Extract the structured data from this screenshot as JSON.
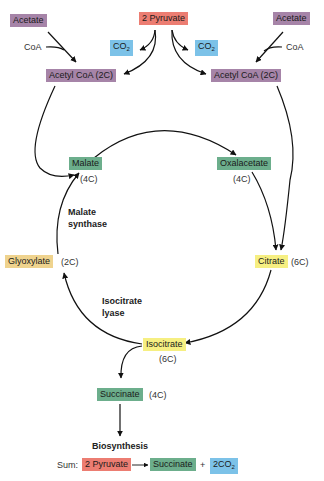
{
  "nodes": {
    "acetate_left": "Acetate",
    "acetate_right": "Acetate",
    "pyruvate": "2 Pyruvate",
    "co2_left": "CO",
    "co2_right": "CO",
    "co2_sub": "2",
    "acetylcoa_left": "Acetyl CoA (2C)",
    "acetylcoa_right": "Acetyl CoA (2C)",
    "malate": "Malate",
    "oxalacetate": "Oxalacetate",
    "glyoxylate": "Glyoxylate",
    "citrate": "Citrate",
    "isocitrate": "Isocitrate",
    "succinate": "Succinate"
  },
  "labels": {
    "coa_left": "CoA",
    "coa_right": "CoA",
    "malate_carbons": "(4C)",
    "oxalacetate_carbons": "(4C)",
    "glyoxylate_carbons": "(2C)",
    "citrate_carbons": "(6C)",
    "isocitrate_carbons": "(6C)",
    "succinate_carbons": "(4C)",
    "malate_synthase_1": "Malate",
    "malate_synthase_2": "synthase",
    "isocitrate_lyase_1": "Isocitrate",
    "isocitrate_lyase_2": "lyase",
    "biosynthesis": "Biosynthesis"
  },
  "sum": {
    "label": "Sum:",
    "reactant": "2 Pyruvate",
    "product": "Succinate",
    "plus": "+",
    "co2": "2CO",
    "co2_sub": "2"
  },
  "colors": {
    "acetyl": "#a684a8",
    "pyruvate": "#ec7d72",
    "co2": "#7cc2e8",
    "four_carbon": "#6cae8c",
    "six_carbon": "#f6ef82",
    "glyoxylate": "#efd38e"
  }
}
